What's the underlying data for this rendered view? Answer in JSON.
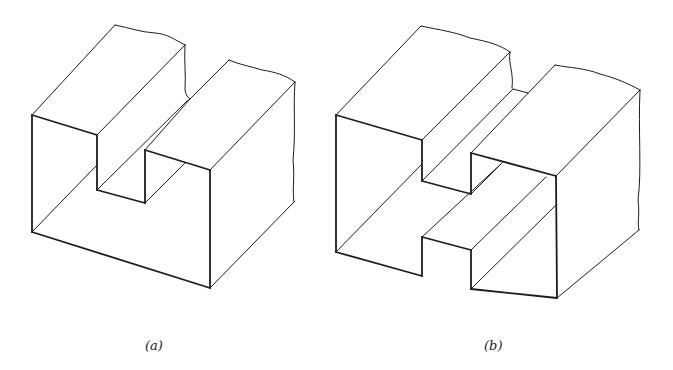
{
  "figures": [
    {
      "id": "a",
      "caption": "(a)",
      "description": "Isometric block with rectangular slot cut in top",
      "caption_pos": {
        "x": 145,
        "y": 338
      }
    },
    {
      "id": "b",
      "caption": "(b)",
      "description": "Isometric block with T-slot / H-shaped through-cut",
      "caption_pos": {
        "x": 484,
        "y": 338
      }
    }
  ],
  "style": {
    "stroke": "#1c1c1c",
    "background": "#ffffff"
  }
}
